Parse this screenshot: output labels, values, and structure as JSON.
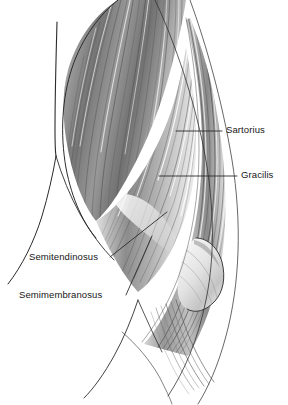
{
  "figure": {
    "type": "anatomical-illustration",
    "style": "grayscale pencil drawing",
    "background_color": "#ffffff",
    "ink_color": "#161616",
    "muscle_shading_color": "#8a8a8a",
    "highlight_color": "#f2f2f2",
    "width": 288,
    "height": 405
  },
  "labels": [
    {
      "id": "sartorius",
      "text": "Sartorius",
      "side": "right",
      "text_x": 226,
      "text_y": 124,
      "leader": {
        "x1": 176,
        "y1": 131,
        "x2": 222,
        "y2": 131
      }
    },
    {
      "id": "gracilis",
      "text": "Gracilis",
      "side": "right",
      "text_x": 241,
      "text_y": 169,
      "leader": {
        "x1": 159,
        "y1": 176,
        "x2": 237,
        "y2": 176
      }
    },
    {
      "id": "semitendinosus",
      "text": "Semitendinosus",
      "side": "left",
      "text_x": 29,
      "text_y": 251,
      "leader": {
        "x1": 110,
        "y1": 257,
        "x2": 167,
        "y2": 212
      }
    },
    {
      "id": "semimembranosus",
      "text": "Semimembranosus",
      "side": "left",
      "text_x": 19,
      "text_y": 289,
      "leader": {
        "x1": 126,
        "y1": 295,
        "x2": 152,
        "y2": 236
      }
    }
  ]
}
